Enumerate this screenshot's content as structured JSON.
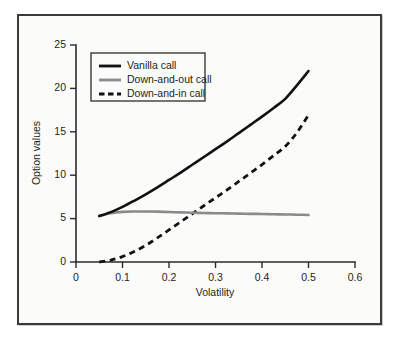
{
  "figure": {
    "background_color": "#fbfbfa",
    "frame_color": "#3a3a3c",
    "page_background": "#ffffff"
  },
  "chart_data": {
    "type": "line",
    "title": "",
    "subtitle": "",
    "xlabel": "Volatility",
    "ylabel": "Option values",
    "xlim": [
      0,
      0.6
    ],
    "ylim": [
      0,
      25
    ],
    "xticks": [
      0,
      0.1,
      0.2,
      0.3,
      0.4,
      0.5,
      0.6
    ],
    "xtick_labels": [
      "0",
      "0.1",
      "0.2",
      "0.3",
      "0.4",
      "0.5",
      "0.6"
    ],
    "yticks": [
      0,
      5,
      10,
      15,
      20,
      25
    ],
    "ytick_labels": [
      "0",
      "5",
      "10",
      "15",
      "20",
      "25"
    ],
    "grid": false,
    "legend_position": "upper-left-inside",
    "annotations": [],
    "x": [
      0.05,
      0.075,
      0.1,
      0.125,
      0.15,
      0.175,
      0.2,
      0.225,
      0.25,
      0.275,
      0.3,
      0.325,
      0.35,
      0.375,
      0.4,
      0.425,
      0.45,
      0.475,
      0.5
    ],
    "series": [
      {
        "name": "Vanilla call",
        "color": "#111113",
        "style": "solid",
        "values": [
          5.3,
          5.75,
          6.35,
          7.05,
          7.8,
          8.6,
          9.45,
          10.3,
          11.2,
          12.1,
          13.0,
          13.9,
          14.85,
          15.8,
          16.75,
          17.75,
          18.8,
          20.35,
          22.0
        ]
      },
      {
        "name": "Down-and-out call",
        "color": "#8a8a8c",
        "style": "solid",
        "values": [
          5.3,
          5.62,
          5.78,
          5.82,
          5.82,
          5.8,
          5.76,
          5.72,
          5.68,
          5.65,
          5.62,
          5.6,
          5.57,
          5.55,
          5.53,
          5.5,
          5.48,
          5.45,
          5.42
        ]
      },
      {
        "name": "Down-and-in call",
        "color": "#111113",
        "style": "dashed",
        "values": [
          0.0,
          0.22,
          0.62,
          1.2,
          1.92,
          2.78,
          3.7,
          4.62,
          5.55,
          6.48,
          7.4,
          8.32,
          9.28,
          10.25,
          11.22,
          12.25,
          13.32,
          14.9,
          16.95
        ]
      }
    ],
    "legend_entries": [
      {
        "label": "Vanilla call",
        "color": "#111113",
        "style": "solid"
      },
      {
        "label": "Down-and-out call",
        "color": "#8a8a8c",
        "style": "solid"
      },
      {
        "label": "Down-and-in call",
        "color": "#111113",
        "style": "dashed"
      }
    ]
  }
}
